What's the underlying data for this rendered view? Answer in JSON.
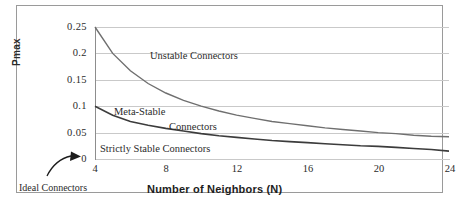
{
  "chart_data": {
    "type": "line",
    "title": "",
    "xlabel": "Number of Neighbors (N)",
    "ylabel": "Pmax",
    "xlim": [
      4,
      24
    ],
    "ylim": [
      0,
      0.25
    ],
    "grid": true,
    "legend": "none",
    "x_ticks": [
      "4",
      "8",
      "12",
      "16",
      "20",
      "24"
    ],
    "y_ticks": [
      "0.25",
      "0.2",
      "0.15",
      "0.1",
      "0.05",
      "0"
    ],
    "x": [
      4,
      5,
      6,
      7,
      8,
      9,
      10,
      11,
      12,
      13,
      14,
      15,
      16,
      17,
      18,
      19,
      20,
      21,
      22,
      23,
      24
    ],
    "series": [
      {
        "name": "Upper boundary (unstable / meta-stable)",
        "color": "#6f6f6f",
        "values": [
          0.25,
          0.2,
          0.167,
          0.143,
          0.125,
          0.111,
          0.1,
          0.091,
          0.083,
          0.077,
          0.071,
          0.067,
          0.063,
          0.059,
          0.056,
          0.053,
          0.05,
          0.048,
          0.045,
          0.043,
          0.042
        ]
      },
      {
        "name": "Lower boundary (meta-stable / strictly stable)",
        "color": "#3c3c3c",
        "values": [
          0.1,
          0.083,
          0.071,
          0.064,
          0.058,
          0.053,
          0.048,
          0.044,
          0.041,
          0.038,
          0.035,
          0.033,
          0.031,
          0.029,
          0.027,
          0.025,
          0.024,
          0.022,
          0.02,
          0.018,
          0.015
        ]
      }
    ],
    "annotations": [
      {
        "name": "unstable-connectors",
        "text": "Unstable Connectors",
        "x": 11.2,
        "y": 0.195
      },
      {
        "name": "meta-stable",
        "text": "Meta-Stable",
        "x": 6.3,
        "y": 0.092
      },
      {
        "name": "meta-stable-connectors",
        "text": "Connectors",
        "x": 10.1,
        "y": 0.071
      },
      {
        "name": "strictly-stable-connectors",
        "text": "Strictly Stable Connectors",
        "x": 5.0,
        "y": 0.035
      },
      {
        "name": "ideal-connectors",
        "text": "Ideal Connectors",
        "x": 4.0,
        "y": 0.0
      }
    ]
  },
  "axis": {
    "y_label": "Pmax",
    "x_label": "Number of Neighbors (N)",
    "y_ticks": [
      "0.25",
      "0.2",
      "0.15",
      "0.1",
      "0.05",
      "0"
    ],
    "x_ticks": [
      "4",
      "8",
      "12",
      "16",
      "20",
      "24"
    ]
  },
  "labels": {
    "unstable": "Unstable Connectors",
    "meta_stable": "Meta-Stable",
    "meta_stable_line2": "Connectors",
    "strictly_stable": "Strictly Stable Connectors",
    "ideal": "Ideal Connectors"
  },
  "colors": {
    "upper_curve": "#6f6f6f",
    "lower_curve": "#3c3c3c",
    "grid": "#c9c9c9",
    "frame": "#9a9a9a",
    "text": "#2b2b2b",
    "background": "#ffffff"
  }
}
